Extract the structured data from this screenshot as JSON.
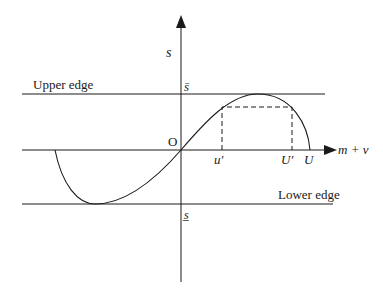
{
  "diagram": {
    "axes": {
      "x_label": "m + v",
      "y_label": "s",
      "origin_label": "O"
    },
    "edges": {
      "upper_label": "Upper edge",
      "lower_label": "Lower edge",
      "upper_value_label": "s̄",
      "lower_value_label": "s̲"
    },
    "x_markers": {
      "u_prime": "u′",
      "U_prime": "U′",
      "U": "U"
    },
    "colors": {
      "line": "#1a1a1a",
      "background": "#ffffff"
    }
  }
}
